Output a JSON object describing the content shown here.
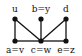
{
  "diagram": {
    "type": "graph",
    "nodes": [
      {
        "id": "u",
        "label": "u",
        "x": 15,
        "y": 19,
        "label_pos": "above"
      },
      {
        "id": "by",
        "label": "b=y",
        "x": 41,
        "y": 19,
        "label_pos": "above"
      },
      {
        "id": "d",
        "label": "d",
        "x": 66,
        "y": 19,
        "label_pos": "above"
      },
      {
        "id": "av",
        "label": "a=v",
        "x": 15,
        "y": 41,
        "label_pos": "below"
      },
      {
        "id": "cw",
        "label": "c=w",
        "x": 41,
        "y": 41,
        "label_pos": "below"
      },
      {
        "id": "ez",
        "label": "e=z",
        "x": 66,
        "y": 41,
        "label_pos": "below"
      }
    ],
    "edges": [
      [
        "u",
        "av"
      ],
      [
        "u",
        "cw"
      ],
      [
        "by",
        "cw"
      ],
      [
        "d",
        "cw"
      ],
      [
        "d",
        "ez"
      ],
      [
        "av",
        "cw"
      ],
      [
        "cw",
        "ez"
      ]
    ],
    "colors": {
      "edge": "#111111",
      "node": "#111111"
    }
  }
}
